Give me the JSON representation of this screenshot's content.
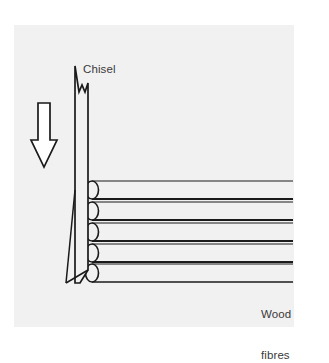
{
  "figure": {
    "title_label": "Chisel",
    "fibres_label_line1": "Wood",
    "fibres_label_line2": "fibres",
    "arrow_name": "direction-of-force-arrow",
    "colors": {
      "panel_background": "#f1f1f1",
      "page_background": "#ffffff",
      "stroke": "#1a1a1a",
      "text": "#3a3a3a",
      "fibre_fill": "#f1f1f1"
    },
    "fibre_count": 5,
    "fibre_rows": [
      {
        "index": 1,
        "y": 190
      },
      {
        "index": 2,
        "y": 211
      },
      {
        "index": 3,
        "y": 232
      },
      {
        "index": 4,
        "y": 253
      },
      {
        "index": 5,
        "y": 273
      }
    ]
  }
}
